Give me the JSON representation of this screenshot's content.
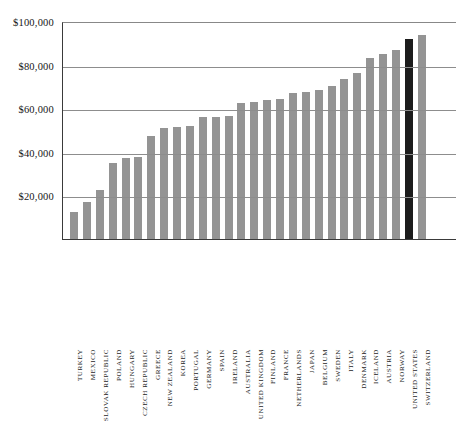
{
  "chart_data": {
    "type": "bar",
    "title": "",
    "subtitle": "",
    "xlabel": "",
    "ylabel": "",
    "ylim": [
      0,
      100000
    ],
    "grid": true,
    "legend": false,
    "value_prefix": "$",
    "y_ticks": [
      {
        "value": 20000,
        "label": "$20,000"
      },
      {
        "value": 40000,
        "label": "$40,000"
      },
      {
        "value": 60000,
        "label": "$60,000"
      },
      {
        "value": 80000,
        "label": "$80,000"
      },
      {
        "value": 100000,
        "label": "$100,000"
      }
    ],
    "categories": [
      "TURKEY",
      "MEXICO",
      "SLOVAK REPUBLIC",
      "POLAND",
      "HUNGARY",
      "CZECH REPUBLIC",
      "GREECE",
      "NEW ZEALAND",
      "KOREA",
      "PORTUGAL",
      "GERMANY",
      "SPAIN",
      "IRELAND",
      "AUSTRALIA",
      "UNITED KINGDOM",
      "FINLAND",
      "FRANCE",
      "NETHERLANDS",
      "JAPAN",
      "BELGIUM",
      "SWEDEN",
      "ITALY",
      "DENMARK",
      "ICELAND",
      "AUSTRIA",
      "NORWAY",
      "UNITED STATES",
      "SWITZERLAND"
    ],
    "values": [
      13000,
      17500,
      23000,
      35500,
      37500,
      38000,
      47500,
      51500,
      52000,
      52500,
      56500,
      56500,
      57000,
      63000,
      63500,
      64000,
      64500,
      67500,
      68000,
      69000,
      70500,
      74000,
      76500,
      83500,
      85500,
      87000,
      92000,
      94000
    ],
    "colors": {
      "bar": "#949494",
      "bar_highlight": "#1c1c1c",
      "axis": "#3a3a3a",
      "gridline": "#8d8d8d",
      "background": "#ffffff",
      "text": "#1a1a1a"
    },
    "highlight_category": "UNITED STATES"
  }
}
